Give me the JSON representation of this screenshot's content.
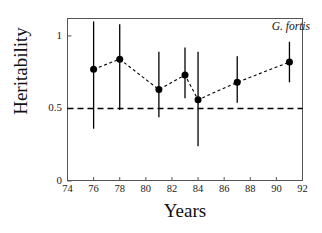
{
  "figure": {
    "annotation": "G. fortis",
    "xlabel": "Years",
    "ylabel": "Heritability"
  },
  "axes": {
    "x_ticks": [
      "74",
      "76",
      "78",
      "80",
      "82",
      "84",
      "86",
      "88",
      "90",
      "92"
    ],
    "y_ticks": [
      "0",
      "0.5",
      "1"
    ]
  },
  "chart_data": {
    "type": "scatter",
    "title": "",
    "annotation": "G. fortis",
    "xlabel": "Years",
    "ylabel": "Heritability",
    "xlim": [
      74,
      92
    ],
    "ylim": [
      0,
      1.12
    ],
    "grid": false,
    "legend": null,
    "x_tick_values": [
      74,
      76,
      78,
      80,
      82,
      84,
      86,
      88,
      90,
      92
    ],
    "y_tick_values": [
      0,
      0.5,
      1
    ],
    "error_bars": true,
    "connector_line": "dashed",
    "reference_line": {
      "y": 0.5,
      "style": "dashed",
      "color": "#000000"
    },
    "marker": {
      "shape": "circle",
      "color": "#000000",
      "size": 7
    },
    "x": [
      76,
      78,
      81,
      83,
      84,
      87,
      91
    ],
    "values": [
      0.77,
      0.84,
      0.63,
      0.73,
      0.56,
      0.68,
      0.82
    ],
    "error_low": [
      0.36,
      0.49,
      0.44,
      0.57,
      0.24,
      0.54,
      0.68
    ],
    "error_high": [
      1.1,
      1.08,
      0.89,
      0.92,
      0.89,
      0.86,
      0.96
    ],
    "points": [
      {
        "year": 76,
        "heritability": 0.77,
        "ci_low": 0.36,
        "ci_high": 1.1
      },
      {
        "year": 78,
        "heritability": 0.84,
        "ci_low": 0.49,
        "ci_high": 1.08
      },
      {
        "year": 81,
        "heritability": 0.63,
        "ci_low": 0.44,
        "ci_high": 0.89
      },
      {
        "year": 83,
        "heritability": 0.73,
        "ci_low": 0.57,
        "ci_high": 0.92
      },
      {
        "year": 84,
        "heritability": 0.56,
        "ci_low": 0.24,
        "ci_high": 0.89
      },
      {
        "year": 87,
        "heritability": 0.68,
        "ci_low": 0.54,
        "ci_high": 0.86
      },
      {
        "year": 91,
        "heritability": 0.82,
        "ci_low": 0.68,
        "ci_high": 0.96
      }
    ]
  },
  "colors": {
    "marker": "#000000",
    "axis": "#555555",
    "text": "#111111"
  }
}
